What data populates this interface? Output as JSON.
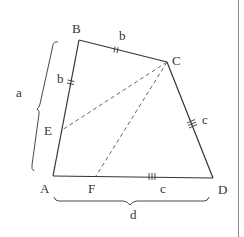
{
  "diagram": {
    "type": "geometry-quadrilateral",
    "colors": {
      "line": "#333333",
      "dashed": "#555555",
      "border": "#8a8a8a",
      "background": "#ffffff"
    },
    "vertices": {
      "A": {
        "label": "A",
        "x": 53,
        "y": 176
      },
      "B": {
        "label": "B",
        "x": 79,
        "y": 40
      },
      "C": {
        "label": "C",
        "x": 167,
        "y": 62
      },
      "D": {
        "label": "D",
        "x": 213,
        "y": 178
      },
      "E": {
        "label": "E",
        "x": 62,
        "y": 130
      },
      "F": {
        "label": "F",
        "x": 96,
        "y": 176
      }
    },
    "side_labels": {
      "BC": "b",
      "BE": "b",
      "CD": "c",
      "FD": "c"
    },
    "brace_labels": {
      "AB": "a",
      "AD": "d"
    },
    "tick_marks": {
      "BC": 2,
      "BE": 2,
      "CD": 3,
      "FD": 3
    },
    "dashed_segments": [
      "CE",
      "CF"
    ]
  }
}
